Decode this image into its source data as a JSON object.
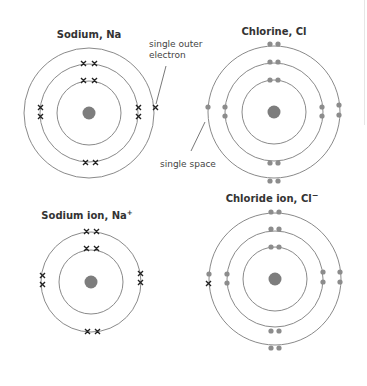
{
  "colors": {
    "shell": "#8a8a8a",
    "nucleus": "#7d7d7d",
    "dot_electron": "#8c8c8c",
    "cross_electron": "#222222",
    "text": "#333333"
  },
  "legend": {
    "cross_icon": "cross-electron (sodium electrons)",
    "dot_icon": "dot-electron (chlorine electrons)"
  },
  "diagrams": [
    {
      "id": "sodium-atom",
      "title": "Sodium, Na",
      "electron_style": "cross",
      "shell_counts": [
        2,
        8,
        1
      ],
      "center": [
        89,
        113
      ]
    },
    {
      "id": "chlorine-atom",
      "title": "Chlorine, Cl",
      "electron_style": "dot",
      "shell_counts": [
        2,
        8,
        7
      ],
      "center": [
        274,
        112
      ]
    },
    {
      "id": "sodium-ion",
      "title": "Sodium ion, Na",
      "title_superscript": "+",
      "electron_style": "cross",
      "shell_counts": [
        2,
        8
      ],
      "center": [
        91,
        282
      ]
    },
    {
      "id": "chloride-ion",
      "title": "Chloride ion, Cl",
      "title_superscript": "−",
      "electron_style": "dot",
      "shell_counts": [
        2,
        8,
        8
      ],
      "extra_cross_electrons": 1,
      "center": [
        275,
        279
      ]
    }
  ],
  "annotations": {
    "outer_electron_line1": "single outer",
    "outer_electron_line2": "electron",
    "single_space": "single space"
  }
}
